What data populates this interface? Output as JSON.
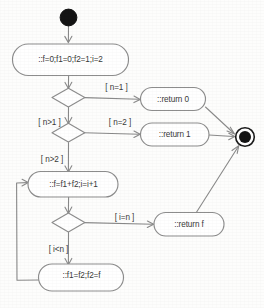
{
  "diagram": {
    "type": "uml-activity-diagram",
    "stroke_color": "#8a8a8a",
    "node_fill": "#ffffff",
    "text_color": "#3a3a3a",
    "marker_color": "#141414",
    "nodes": {
      "initial": {
        "name": "initial-node",
        "label": ""
      },
      "init_action": {
        "label": "::f=0;f1=0;f2=1;i=2"
      },
      "decision_n1": {
        "label": ""
      },
      "decision_n2": {
        "label": ""
      },
      "decision_i": {
        "label": ""
      },
      "return_zero": {
        "label": "::return 0"
      },
      "return_one": {
        "label": "::return 1"
      },
      "return_f": {
        "label": "::return f"
      },
      "loop_action": {
        "label": "::f=f1+f2;i=i+1"
      },
      "shift_action": {
        "label": "::f1=f2;f2=f"
      },
      "final": {
        "name": "final-node",
        "label": ""
      }
    },
    "guards": {
      "n_eq_1": "[ n=1 ]",
      "n_gt_1": "[ n>1 ]",
      "n_eq_2": "[ n=2 ]",
      "n_gt_2": "[ n>2 ]",
      "i_eq_n": "[ i=n ]",
      "i_lt_n": "[ i<n ]"
    }
  }
}
